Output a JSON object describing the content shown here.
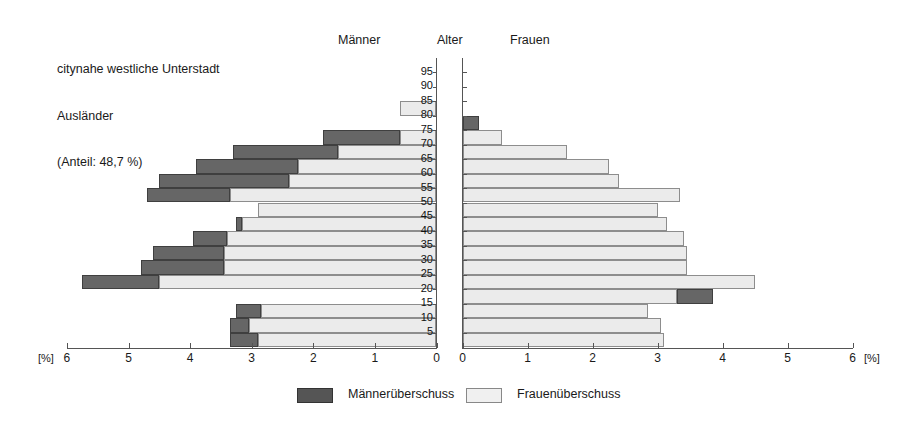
{
  "title": {
    "line1": "citynahe westliche Unterstadt",
    "line2": "Ausländer",
    "line3": "(Anteil: 48,7 %)"
  },
  "headers": {
    "left": "Männer",
    "center": "Alter",
    "right": "Frauen"
  },
  "legend": {
    "men_surplus": "Männerüberschuss",
    "women_surplus": "Frauenüberschuss"
  },
  "axis": {
    "unit": "[%]",
    "left_ticks": [
      "6",
      "5",
      "4",
      "3",
      "2",
      "1",
      "0"
    ],
    "right_ticks": [
      "0",
      "1",
      "2",
      "3",
      "4",
      "5",
      "6"
    ],
    "age_ticks": [
      "95",
      "90",
      "85",
      "80",
      "75",
      "70",
      "65",
      "60",
      "55",
      "50",
      "45",
      "40",
      "35",
      "30",
      "25",
      "20",
      "15",
      "10",
      "5"
    ],
    "max_percent": 6
  },
  "colors": {
    "men_surplus": "#666666",
    "women_surplus": "#ebebeb",
    "axis": "#555555",
    "text": "#1a1a1a"
  },
  "chart_data": {
    "type": "bar",
    "subtitle": "Bevölkerungspyramide nach Alter und Geschlecht",
    "xlabel": "[%]",
    "ylabel": "Alter",
    "xlim": [
      0,
      6
    ],
    "grid": true,
    "legend_position": "bottom",
    "age_groups": [
      "0-5",
      "5-10",
      "10-15",
      "15-20",
      "20-25",
      "25-30",
      "30-35",
      "35-40",
      "40-45",
      "45-50",
      "50-55",
      "55-60",
      "60-65",
      "65-70",
      "70-75",
      "75-80",
      "80-85",
      "85-90",
      "90-95",
      "95+"
    ],
    "series": [
      {
        "name": "Männer",
        "values": [
          3.35,
          3.35,
          3.25,
          0.0,
          5.75,
          4.8,
          4.6,
          3.95,
          3.25,
          2.9,
          4.7,
          4.5,
          3.9,
          3.3,
          1.85,
          0.0,
          0.6,
          0.0,
          0.0,
          0.0
        ]
      },
      {
        "name": "Frauen",
        "values": [
          3.1,
          3.05,
          2.85,
          3.85,
          4.5,
          3.45,
          3.45,
          3.4,
          3.15,
          3.0,
          3.35,
          2.4,
          2.25,
          1.6,
          0.6,
          0.25,
          0.0,
          0.0,
          0.0,
          0.0
        ]
      }
    ],
    "surplus_segments": {
      "note": "Dark segments mark the sex with the surplus; light segments mark the opposite-sex surplus colour fill.",
      "men_side_dark": [
        {
          "age": "0-5",
          "from": 2.9,
          "to": 3.35
        },
        {
          "age": "5-10",
          "from": 3.05,
          "to": 3.35
        },
        {
          "age": "10-15",
          "from": 2.85,
          "to": 3.25
        },
        {
          "age": "20-25",
          "from": 4.5,
          "to": 5.75
        },
        {
          "age": "25-30",
          "from": 3.45,
          "to": 4.8
        },
        {
          "age": "30-35",
          "from": 3.45,
          "to": 4.6
        },
        {
          "age": "35-40",
          "from": 3.4,
          "to": 3.95
        },
        {
          "age": "40-45",
          "from": 3.15,
          "to": 3.25
        },
        {
          "age": "50-55",
          "from": 3.35,
          "to": 4.7
        },
        {
          "age": "55-60",
          "from": 2.4,
          "to": 4.5
        },
        {
          "age": "60-65",
          "from": 2.25,
          "to": 3.9
        },
        {
          "age": "65-70",
          "from": 1.6,
          "to": 3.3
        },
        {
          "age": "70-75",
          "from": 0.6,
          "to": 1.85
        }
      ],
      "women_side_dark": [
        {
          "age": "15-20",
          "from": 3.3,
          "to": 3.85
        },
        {
          "age": "75-80",
          "from": 0.0,
          "to": 0.25
        }
      ]
    }
  }
}
